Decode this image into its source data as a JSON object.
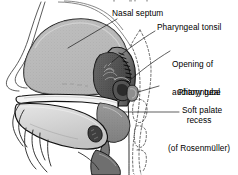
{
  "figure": {
    "title_fragment_visible": false,
    "kind": "anatomical-illustration",
    "style": "grayscale line drawing with stippled shading"
  },
  "labels": {
    "nasal_septum": "Nasal septum",
    "pharyngeal_tonsil": "Pharyngeal tonsil",
    "opening_of_auditory_tube_line1": "Opening of",
    "opening_of_auditory_tube_line2": "auditory tube",
    "pharyngeal_recess_line1": "Pharyngeal",
    "pharyngeal_recess_line2": "recess",
    "pharyngeal_recess_line3": "(of Rosenmüller)",
    "soft_palate": "Soft palate"
  },
  "colors": {
    "background": "#ffffff",
    "ink": "#000000",
    "septum_fill": "#a8a8a8",
    "septum_fill_light": "#bdbdbd",
    "mucosa_mid": "#8a8a8a",
    "mucosa_dark": "#5c5c5c",
    "tonsil_dark": "#3a3a3a",
    "palate_fill": "#f2f2f2",
    "tongue_fill": "#d8d8d8",
    "leader_line": "#1a1a1a"
  },
  "leaders": [
    {
      "name": "leader-nasal-septum",
      "from": [
        118,
        19
      ],
      "to": [
        68,
        48
      ]
    },
    {
      "name": "leader-pharyngeal-tonsil",
      "from": [
        156,
        31
      ],
      "to": [
        112,
        62
      ]
    },
    {
      "name": "leader-opening-auditory-tube",
      "from": [
        171,
        50
      ],
      "to": [
        126,
        83
      ]
    },
    {
      "name": "leader-pharyngeal-recess",
      "from": [
        160,
        86
      ],
      "to": [
        134,
        93
      ]
    },
    {
      "name": "leader-soft-palate",
      "from": [
        178,
        112
      ],
      "to": [
        124,
        112
      ]
    }
  ]
}
